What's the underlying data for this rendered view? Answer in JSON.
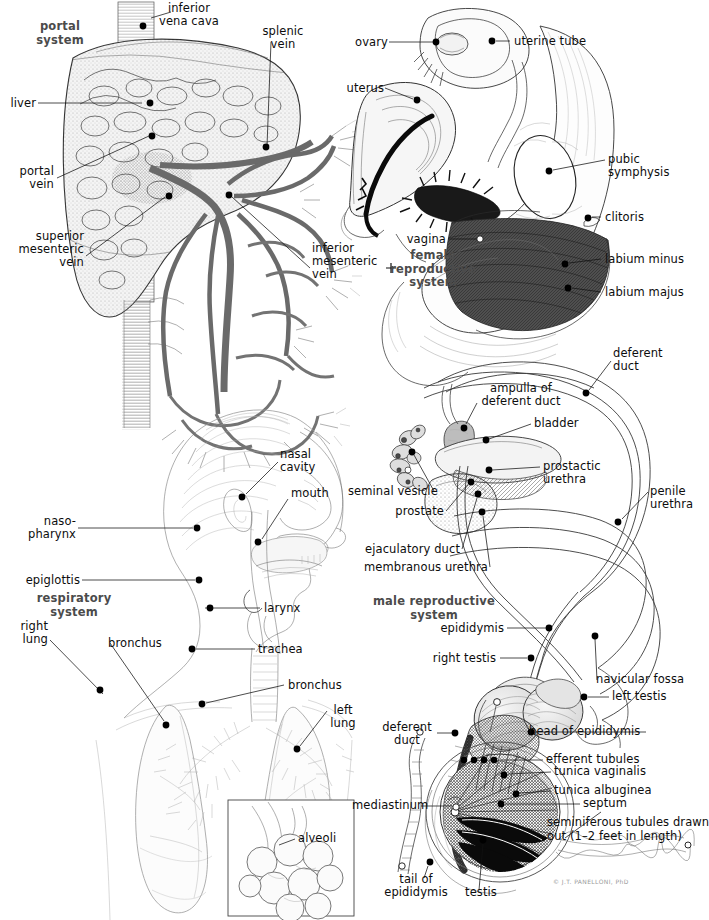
{
  "page": {
    "width": 695,
    "height": 920,
    "background": "#ffffff",
    "ink_color": "#111111",
    "system_label_color": "#4b4b4b",
    "signature": "© J.T. PANELLONI, PhD"
  },
  "panels": [
    {
      "id": "portal-system",
      "system_label": "portal\nsystem",
      "labels": [
        {
          "name": "inferior-vena-cava",
          "text": "inferior\nvena cava"
        },
        {
          "name": "splenic-vein",
          "text": "splenic\nvein"
        },
        {
          "name": "liver",
          "text": "liver"
        },
        {
          "name": "portal-vein",
          "text": "portal\nvein"
        },
        {
          "name": "superior-mesenteric-vein",
          "text": "superior\nmesenteric\nvein"
        },
        {
          "name": "inferior-mesenteric-vein",
          "text": "inferior\nmesenteric\nvein"
        }
      ]
    },
    {
      "id": "female-reproductive-system",
      "system_label": "female\nreproductive\nsystem",
      "labels": [
        {
          "name": "ovary",
          "text": "ovary"
        },
        {
          "name": "uterine-tube",
          "text": "uterine tube"
        },
        {
          "name": "uterus",
          "text": "uterus"
        },
        {
          "name": "pubic-symphysis",
          "text": "pubic\nsymphysis"
        },
        {
          "name": "clitoris",
          "text": "clitoris"
        },
        {
          "name": "vagina",
          "text": "vagina"
        },
        {
          "name": "labium-minus",
          "text": "labium minus"
        },
        {
          "name": "labium-majus",
          "text": "labium majus"
        }
      ]
    },
    {
      "id": "respiratory-system",
      "system_label": "respiratory\nsystem",
      "labels": [
        {
          "name": "nasal-cavity",
          "text": "nasal\ncavity"
        },
        {
          "name": "mouth",
          "text": "mouth"
        },
        {
          "name": "nasopharynx",
          "text": "naso-\npharynx"
        },
        {
          "name": "epiglottis",
          "text": "epiglottis"
        },
        {
          "name": "larynx",
          "text": "larynx"
        },
        {
          "name": "right-lung",
          "text": "right\nlung"
        },
        {
          "name": "bronchus-left-side",
          "text": "bronchus"
        },
        {
          "name": "trachea",
          "text": "trachea"
        },
        {
          "name": "bronchus-right-side",
          "text": "bronchus"
        },
        {
          "name": "left-lung",
          "text": "left\nlung"
        },
        {
          "name": "alveoli",
          "text": "alveoli"
        }
      ]
    },
    {
      "id": "male-reproductive-system",
      "system_label": "male reproductive\nsystem",
      "labels": [
        {
          "name": "deferent-duct",
          "text": "deferent\nduct"
        },
        {
          "name": "ampulla-of-deferent-duct",
          "text": "ampulla of\ndeferent duct"
        },
        {
          "name": "bladder",
          "text": "bladder"
        },
        {
          "name": "prostatic-urethra",
          "text": "prostactic\nurethra"
        },
        {
          "name": "seminal-vesicle",
          "text": "seminal vesicle"
        },
        {
          "name": "prostate",
          "text": "prostate"
        },
        {
          "name": "ejaculatory-duct",
          "text": "ejaculatory duct"
        },
        {
          "name": "membranous-urethra",
          "text": "membranous urethra"
        },
        {
          "name": "penile-urethra",
          "text": "penile\nurethra"
        },
        {
          "name": "epididymis",
          "text": "epididymis"
        },
        {
          "name": "right-testis",
          "text": "right testis"
        },
        {
          "name": "navicular-fossa",
          "text": "navicular fossa"
        },
        {
          "name": "left-testis",
          "text": "left testis"
        }
      ]
    },
    {
      "id": "testis-detail",
      "system_label": "",
      "labels": [
        {
          "name": "deferent-duct-detail",
          "text": "deferent\nduct"
        },
        {
          "name": "head-of-epididymis",
          "text": "head of epididymis"
        },
        {
          "name": "efferent-tubules",
          "text": "efferent tubules"
        },
        {
          "name": "tunica-vaginalis",
          "text": "tunica vaginalis"
        },
        {
          "name": "tunica-albuginea",
          "text": "tunica albuginea"
        },
        {
          "name": "septum",
          "text": "septum"
        },
        {
          "name": "mediastinum",
          "text": "mediastinum"
        },
        {
          "name": "seminiferous-tubules",
          "text": "seminiferous tubules drawn\nout (1–2 feet in length)"
        },
        {
          "name": "tail-of-epididymis",
          "text": "tail of\nepididymis"
        },
        {
          "name": "testis",
          "text": "testis"
        }
      ]
    }
  ]
}
